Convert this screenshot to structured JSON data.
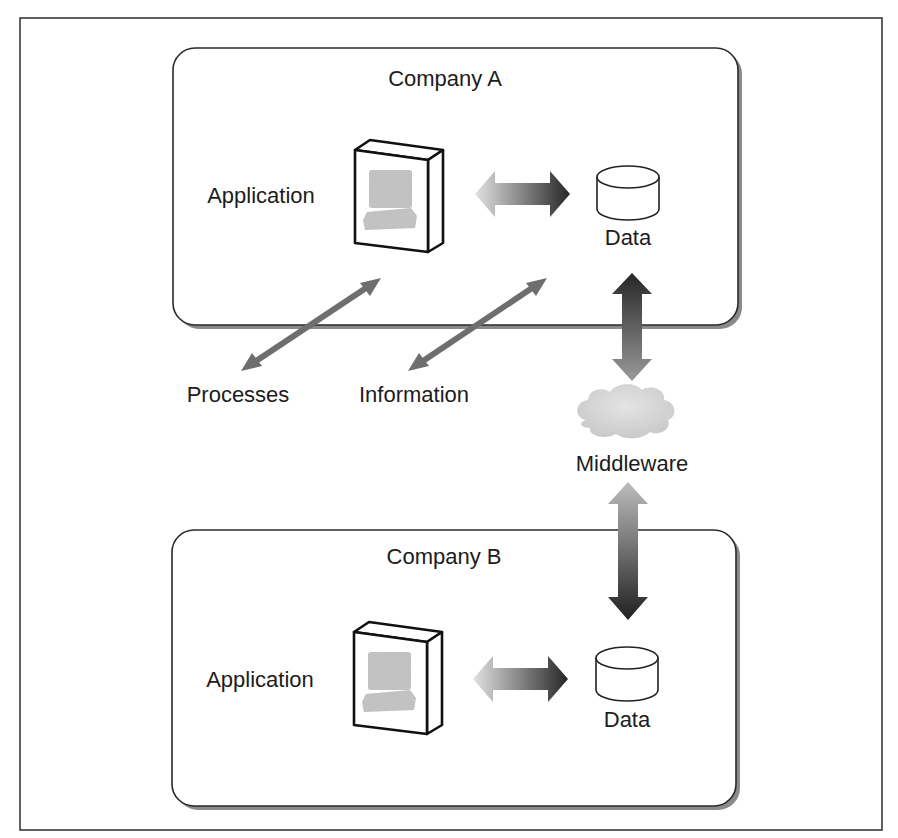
{
  "diagram": {
    "type": "architecture",
    "companies": [
      {
        "id": "company-a",
        "title": "Company A",
        "application_label": "Application",
        "data_label": "Data"
      },
      {
        "id": "company-b",
        "title": "Company B",
        "application_label": "Application",
        "data_label": "Data"
      }
    ],
    "external_labels": {
      "processes": "Processes",
      "information": "Information",
      "middleware": "Middleware"
    },
    "connections": [
      {
        "from": "Company A Application",
        "to": "Company A Data",
        "type": "bidirectional"
      },
      {
        "from": "Company A Data",
        "to": "Middleware",
        "type": "bidirectional"
      },
      {
        "from": "Middleware",
        "to": "Company B Data",
        "type": "bidirectional"
      },
      {
        "from": "Company B Application",
        "to": "Company B Data",
        "type": "bidirectional"
      },
      {
        "from": "Processes",
        "to": "Company A Application",
        "type": "bidirectional"
      },
      {
        "from": "Information",
        "to": "Company A Data",
        "type": "bidirectional"
      }
    ],
    "colors": {
      "stroke": "#2a2a2a",
      "shadow": "#8a8a8a",
      "arrow_dark": "#2b2b2b",
      "arrow_light": "#d8d8d8",
      "thin_arrow": "#6e6e6e",
      "cloud": "#d4d4d4",
      "screen": "#b9b9b9"
    }
  }
}
